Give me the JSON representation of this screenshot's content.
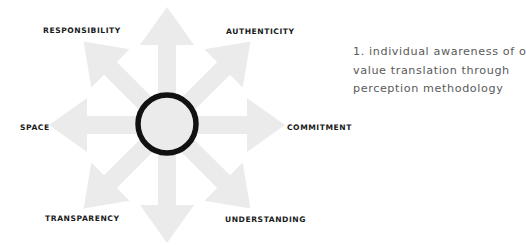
{
  "diagram": {
    "type": "radial-arrows",
    "center": {
      "x": 167,
      "y": 125
    },
    "arrow_color": "#ebebeb",
    "circle": {
      "stroke_color": "#111111",
      "fill_color": "#ebebeb",
      "radius": 29,
      "stroke_width": 5.5
    },
    "arrow_count": 8
  },
  "labels": {
    "top_left": "RESPONSIBILITY",
    "top_right": "AUTHENTICITY",
    "left": "SPACE",
    "right": "COMMITMENT",
    "bottom_left": "TRANSPARENCY",
    "bottom_right": "UNDERSTANDING"
  },
  "description": {
    "lines": [
      "1. individual awareness of own",
      "value translation through",
      "perception methodology"
    ]
  },
  "colors": {
    "label_text": "#1a1a1a",
    "description_text": "#5a5a5a",
    "arrows": "#ebebeb",
    "ring": "#111111"
  }
}
